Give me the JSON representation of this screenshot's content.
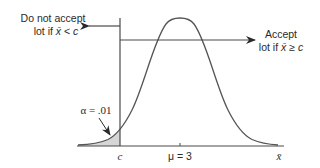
{
  "diagram": {
    "type": "normal-distribution-acceptance-sampling",
    "left_label": {
      "line1": "Do not accept",
      "line2_prefix": "lot if ",
      "line2_var": "x̄",
      "line2_op": " < ",
      "line2_c": "c"
    },
    "right_label": {
      "line1": "Accept",
      "line2_prefix": "lot if ",
      "line2_var": "x̄",
      "line2_op": " ≥ ",
      "line2_c": "c"
    },
    "alpha_label": "α = .01",
    "axis": {
      "c_label": "c",
      "mu_label": "μ = 3",
      "x_label": "x̄"
    },
    "colors": {
      "line": "#4a4a4a",
      "shade": "#d4d4d4",
      "text": "#2a2a2a"
    }
  }
}
